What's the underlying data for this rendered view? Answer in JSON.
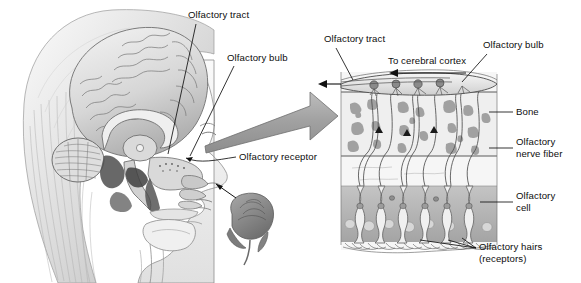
{
  "figure": {
    "background_color": "#ffffff",
    "ink_color": "#0d0d0d"
  },
  "left_panel": {
    "name": "sagittal-head-illustration",
    "description": "Midsagittal section of a human head showing the brain, nasal cavity and olfactory region, drawn in grayscale pencil style, with a rose held near the nose",
    "labels": [
      {
        "id": "olfactory-tract",
        "text": "Olfactory tract",
        "x": 188,
        "y": 11
      },
      {
        "id": "olfactory-bulb",
        "text": "Olfactory bulb",
        "x": 227,
        "y": 54
      },
      {
        "id": "olfactory-receptor",
        "text": "Olfactory receptor",
        "x": 238,
        "y": 155
      }
    ],
    "elements": {
      "head_outline": "female head in left-facing profile",
      "brain": "cerebrum with gyri, corpus callosum, thalamus, cerebellum, brainstem",
      "nasal_cavity": "nasal conchae and nasopharynx",
      "rose": "rose bud with stem, gray tone",
      "oral_cavity": "tongue and oral cavity"
    },
    "colors": {
      "tissue_light": "#f2f2f2",
      "tissue_mid": "#c8c8c8",
      "tissue_dark": "#8a8a8a",
      "shadow": "#4a4a4a"
    }
  },
  "connector_arrow": {
    "name": "magnification-arrow",
    "description": "Wide gray tapering arrow pointing right, linking the olfactory region of the head to the magnified epithelium diagram",
    "fill": "#a6a6a6",
    "stroke": "#6e6e6e"
  },
  "right_panel": {
    "name": "olfactory-epithelium-detail",
    "description": "Magnified cross-section through the cribriform plate showing olfactory bulb, bone, nerve fibers, olfactory cells and olfactory hairs",
    "labels": [
      {
        "id": "olfactory-tract",
        "text": "Olfactory tract",
        "x": 326,
        "y": 38
      },
      {
        "id": "to-cerebral-cortex",
        "text": "To cerebral cortex",
        "x": 389,
        "y": 59
      },
      {
        "id": "olfactory-bulb",
        "text": "Olfactory bulb",
        "x": 484,
        "y": 43
      },
      {
        "id": "bone",
        "text": "Bone",
        "x": 517,
        "y": 107
      },
      {
        "id": "olfactory-nerve-fiber",
        "text": "Olfactory\nnerve fiber",
        "x": 517,
        "y": 142
      },
      {
        "id": "olfactory-cell",
        "text": "Olfactory\ncell",
        "x": 517,
        "y": 195
      },
      {
        "id": "olfactory-hairs",
        "text": "Olfactory hairs\n(receptors)",
        "x": 480,
        "y": 247
      }
    ],
    "layers": [
      {
        "id": "olfactory-bulb-layer",
        "label": "Olfactory bulb",
        "fill": "#e8e8e8"
      },
      {
        "id": "bone-layer",
        "label": "Bone",
        "fill": "#efefef",
        "note": "cribriform plate with trabecular spaces"
      },
      {
        "id": "nerve-fiber-layer",
        "label": "Olfactory nerve fiber",
        "fill": "#f4f4f4"
      },
      {
        "id": "epithelium-layer",
        "label": "Olfactory cell",
        "fill": "#b4b4b4"
      },
      {
        "id": "hair-layer",
        "label": "Olfactory hairs (receptors)",
        "fill": "#ffffff"
      }
    ],
    "colors": {
      "panel_fill": "#f4f4f4",
      "bone_fill": "#efefef",
      "bone_speck": "#9a9a9a",
      "epithelium_fill": "#b0b0b0",
      "cell_fill": "#e6e6e6",
      "outline": "#3c3c3c"
    },
    "arrows": [
      {
        "id": "tract-arrow",
        "direction": "left",
        "description": "arrow exiting olfactory tract to the left"
      },
      {
        "id": "cortex-arrow",
        "direction": "left",
        "description": "arrow under the To cerebral cortex label"
      }
    ]
  }
}
